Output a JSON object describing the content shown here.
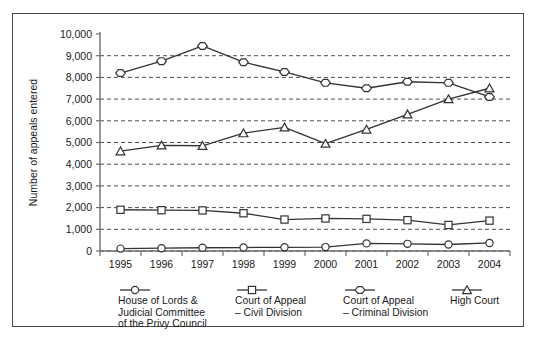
{
  "chart_data": {
    "type": "line",
    "title": "",
    "xlabel": "",
    "ylabel": "Number of appeals entered",
    "categories": [
      "1995",
      "1996",
      "1997",
      "1998",
      "1999",
      "2000",
      "2001",
      "2002",
      "2003",
      "2004"
    ],
    "ylim": [
      0,
      10000
    ],
    "ytick_labels": [
      "0",
      "1,000",
      "2,000",
      "3,000",
      "4,000",
      "5,000",
      "6,000",
      "7,000",
      "8,000",
      "9,000",
      "10,000"
    ],
    "ytick_values": [
      0,
      1000,
      2000,
      3000,
      4000,
      5000,
      6000,
      7000,
      8000,
      9000,
      10000
    ],
    "grid": true,
    "grid_style": "dashed-horizontal",
    "legend_position": "below",
    "series": [
      {
        "name": "House of Lords &\nJudicial Committee\nof the Privy Council",
        "marker": "circle",
        "values": [
          110,
          130,
          150,
          160,
          170,
          180,
          350,
          330,
          300,
          370
        ]
      },
      {
        "name": "Court of Appeal\n– Civil Division",
        "marker": "square",
        "values": [
          1900,
          1880,
          1870,
          1740,
          1450,
          1500,
          1480,
          1420,
          1200,
          1400
        ]
      },
      {
        "name": "Court of Appeal\n– Criminal Division",
        "marker": "hexagon",
        "values": [
          8200,
          8750,
          9450,
          8700,
          8250,
          7750,
          7500,
          7800,
          7750,
          7100
        ]
      },
      {
        "name": "High Court",
        "marker": "triangle",
        "values": [
          4600,
          4870,
          4850,
          5430,
          5700,
          4950,
          5600,
          6300,
          7000,
          7500
        ]
      }
    ]
  },
  "legend": {
    "entries": [
      {
        "label": "House of Lords &\nJudicial Committee\nof the Privy Council",
        "marker": "circle"
      },
      {
        "label": "Court of Appeal\n– Civil Division",
        "marker": "square"
      },
      {
        "label": "Court of Appeal\n– Criminal Division",
        "marker": "hexagon"
      },
      {
        "label": "High Court",
        "marker": "triangle"
      }
    ]
  },
  "colors": {
    "line": "#333333",
    "marker_fill": "#ffffff",
    "axis": "#6e6e6e",
    "grid": "#3a3a3a",
    "border": "#4a4a4a",
    "text": "#1a1a1a"
  }
}
